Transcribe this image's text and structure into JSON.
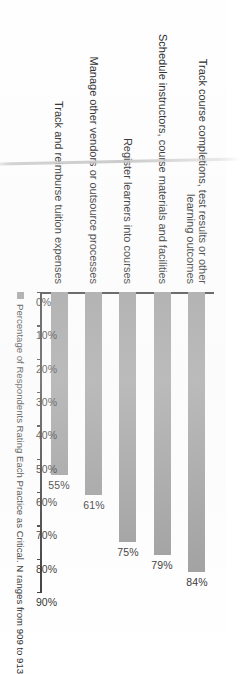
{
  "chart_data": {
    "type": "bar",
    "orientation": "horizontal",
    "title": "",
    "xlabel": "",
    "ylabel": "",
    "categories": [
      "Track course completions, test results or other\nlearning outcomes",
      "Schedule instructors, course materials and facilities",
      "Register learners into courses",
      "Manage other vendors or outsource processes",
      "Track and reimburse tuition expenses"
    ],
    "values": [
      84,
      79,
      75,
      61,
      55
    ],
    "value_labels": [
      "84%",
      "79%",
      "75%",
      "61%",
      "55%"
    ],
    "tick_labels": [
      "0%",
      "10%",
      "20%",
      "30%",
      "40%",
      "50%",
      "60%",
      "70%",
      "80%",
      "90%"
    ],
    "tick_values": [
      0,
      10,
      20,
      30,
      40,
      50,
      60,
      70,
      80,
      90
    ],
    "xlim": [
      0,
      90
    ],
    "grid": false,
    "legend_position": "bottom-left",
    "series": [
      {
        "name": "Percentage of Respondents Rating Each Practice as Critical. N ranges from 909 to 913",
        "values": [
          84,
          79,
          75,
          61,
          55
        ],
        "color": "#9b9b9b"
      }
    ]
  },
  "legend": {
    "swatch_icon": "legend-square-icon",
    "note": "Percentage of Respondents Rating Each Practice as Critical. N ranges from 909 to 913",
    "color": "#9b9b9b"
  },
  "axis": {
    "line_color": "#3a3a3a"
  }
}
